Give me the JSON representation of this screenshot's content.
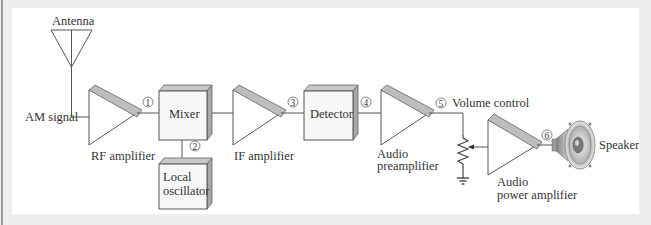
{
  "diagram": {
    "colors": {
      "background": "#ffffff",
      "frame": "#eeeeee",
      "line": "#555555",
      "block_face": "#f7f7f7",
      "block_top": "#c8c8c8",
      "block_side": "#a8a8a8",
      "amp_bar": "#bdbdbd"
    },
    "labels": {
      "antenna": "Antenna",
      "am_signal": "AM signal",
      "rf_amplifier": "RF amplifier",
      "mixer": "Mixer",
      "local_oscillator_line1": "Local",
      "local_oscillator_line2": "oscillator",
      "if_amplifier": "IF amplifier",
      "detector": "Detector",
      "audio_preamp_line1": "Audio",
      "audio_preamp_line2": "preamplifier",
      "volume_control": "Volume control",
      "audio_power_line1": "Audio",
      "audio_power_line2": "power amplifier",
      "speaker": "Speaker"
    },
    "test_points": [
      "1",
      "2",
      "3",
      "4",
      "5",
      "6"
    ],
    "icons": [
      "antenna-icon",
      "amplifier-icon",
      "block-icon",
      "potentiometer-icon",
      "ground-icon",
      "speaker-icon"
    ]
  }
}
